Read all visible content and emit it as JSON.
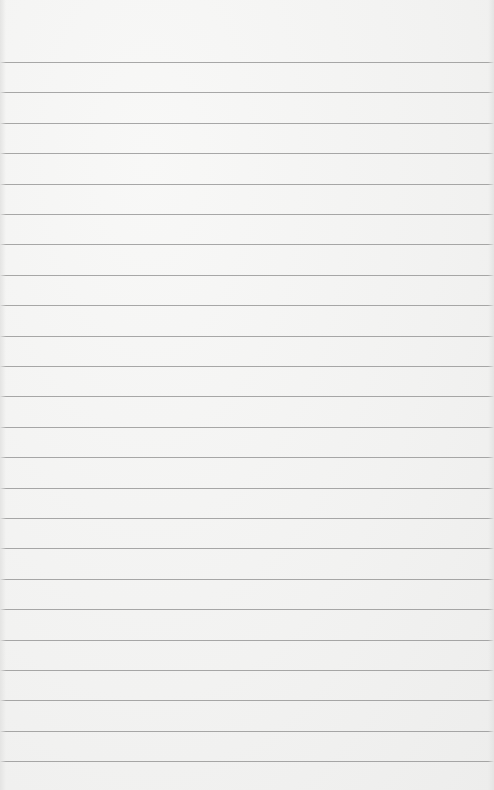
{
  "page": {
    "type": "lined-paper",
    "background_color": "#f5f5f4",
    "line_color": "#8c8c8c",
    "line_count": 24,
    "first_line_y": 62,
    "line_spacing": 30.4
  }
}
